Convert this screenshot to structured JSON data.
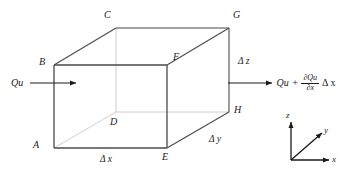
{
  "figure": {
    "type": "control-volume-cube-diagram",
    "background_color": "#ffffff",
    "line_color_visible": "#4a4a4a",
    "line_color_hidden": "#c8c8c8",
    "text_color": "#1a1a1a"
  },
  "vertices": [
    {
      "id": "A",
      "label": "A",
      "position": "front-bottom-left"
    },
    {
      "id": "B",
      "label": "B",
      "position": "front-top-left"
    },
    {
      "id": "C",
      "label": "C",
      "position": "back-top-left"
    },
    {
      "id": "D",
      "label": "D",
      "position": "back-bottom-left-hidden"
    },
    {
      "id": "E",
      "label": "E",
      "position": "front-bottom-right"
    },
    {
      "id": "F",
      "label": "F",
      "position": "front-top-right"
    },
    {
      "id": "G",
      "label": "G",
      "position": "back-top-right"
    },
    {
      "id": "H",
      "label": "H",
      "position": "back-bottom-right"
    }
  ],
  "dimensions": [
    {
      "id": "dx",
      "label": "Δ x",
      "edge": "bottom-front",
      "axis": "x"
    },
    {
      "id": "dy",
      "label": "Δ y",
      "edge": "bottom-right-receding",
      "axis": "y"
    },
    {
      "id": "dz",
      "label": "Δ z",
      "edge": "right-vertical",
      "axis": "z"
    }
  ],
  "flux": {
    "inflow": {
      "label": "Qu",
      "direction": "right",
      "description": "mass flux entering left face"
    },
    "outflow": {
      "base": "Qu",
      "operator": "+",
      "fraction_numerator": "∂Qu",
      "fraction_denominator": "∂x",
      "multiplier": "Δ x",
      "direction": "right",
      "description": "mass flux leaving right face"
    }
  },
  "axes": {
    "x": {
      "label": "x",
      "direction": "right"
    },
    "y": {
      "label": "y",
      "direction": "up-right-diagonal"
    },
    "z": {
      "label": "z",
      "direction": "up"
    }
  }
}
